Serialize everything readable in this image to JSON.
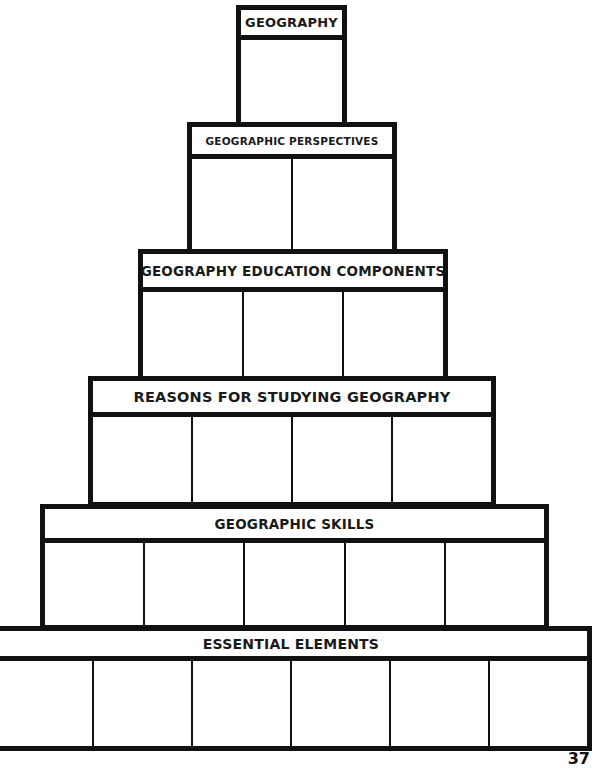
{
  "diagram": {
    "type": "pyramid-graphic-organizer",
    "tiers": [
      {
        "title": "GEOGRAPHY",
        "cells": 1
      },
      {
        "title": "GEOGRAPHIC PERSPECTIVES",
        "cells": 2
      },
      {
        "title": "GEOGRAPHY EDUCATION COMPONENTS",
        "cells": 3
      },
      {
        "title": "REASONS FOR STUDYING GEOGRAPHY",
        "cells": 4
      },
      {
        "title": "GEOGRAPHIC SKILLS",
        "cells": 5
      },
      {
        "title": "ESSENTIAL ELEMENTS",
        "cells": 6
      }
    ]
  },
  "page_number": "37"
}
